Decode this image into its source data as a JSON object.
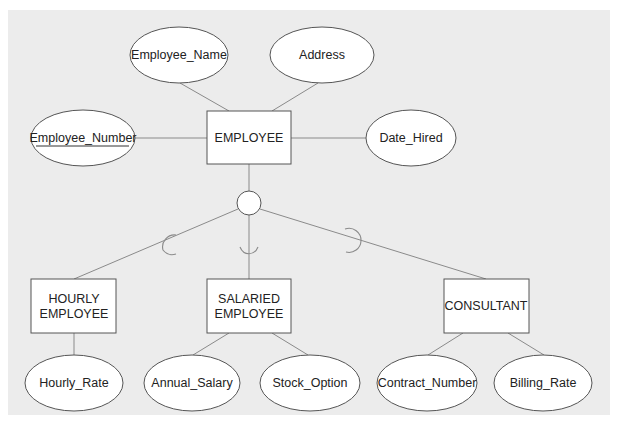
{
  "diagram": {
    "type": "EER diagram - supertype/subtype",
    "supertype": {
      "name": "EMPLOYEE",
      "attributes": [
        {
          "name": "Employee_Name",
          "is_key": false
        },
        {
          "name": "Address",
          "is_key": false
        },
        {
          "name": "Employee_Number",
          "is_key": true
        },
        {
          "name": "Date_Hired",
          "is_key": false
        }
      ]
    },
    "subtypes": [
      {
        "line1": "HOURLY",
        "line2": "EMPLOYEE",
        "attributes": [
          "Hourly_Rate"
        ]
      },
      {
        "line1": "SALARIED",
        "line2": "EMPLOYEE",
        "attributes": [
          "Annual_Salary",
          "Stock_Option"
        ]
      },
      {
        "line1": "CONSULTANT",
        "line2": "",
        "attributes": [
          "Contract_Number",
          "Billing_Rate"
        ]
      }
    ]
  },
  "colors": {
    "panel": "#ececec",
    "shape_fill": "#ffffff",
    "shape_stroke": "#555555",
    "connector": "#8a8a8a",
    "text": "#222222"
  }
}
